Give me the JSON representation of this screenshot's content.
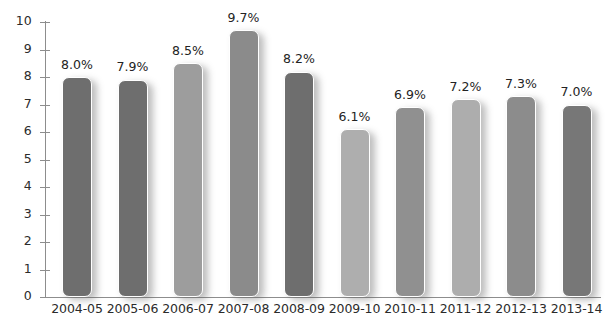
{
  "chart_data": {
    "type": "bar",
    "title": "",
    "subtitle": "",
    "xlabel": "",
    "ylabel": "",
    "ylim": [
      0,
      10
    ],
    "ytick_labels": [
      "0",
      "1",
      "2",
      "3",
      "4",
      "5",
      "6",
      "7",
      "8",
      "9",
      "10"
    ],
    "ytick_values": [
      0,
      1,
      2,
      3,
      4,
      5,
      6,
      7,
      8,
      9,
      10
    ],
    "grid": false,
    "legend": null,
    "categories": [
      "2004-05",
      "2005-06",
      "2006-07",
      "2007-08",
      "2008-09",
      "2009-10",
      "2010-11",
      "2011-12",
      "2012-13",
      "2013-14"
    ],
    "values": [
      8.0,
      7.9,
      8.5,
      9.7,
      8.2,
      6.1,
      6.9,
      7.2,
      7.3,
      7.0
    ],
    "data_labels": [
      "8.0%",
      "7.9%",
      "8.5%",
      "9.7%",
      "8.2%",
      "6.1%",
      "6.9%",
      "7.2%",
      "7.3%",
      "7.0%"
    ],
    "bar_colors": [
      "#6e6e6e",
      "#6e6e6e",
      "#9d9d9d",
      "#8b8b8b",
      "#6e6e6e",
      "#aeaeae",
      "#909090",
      "#adadad",
      "#8c8c8c",
      "#777777"
    ],
    "axis_color": "#8d8d8d",
    "label_color": "#2b2b2b",
    "background": "#ffffff"
  }
}
